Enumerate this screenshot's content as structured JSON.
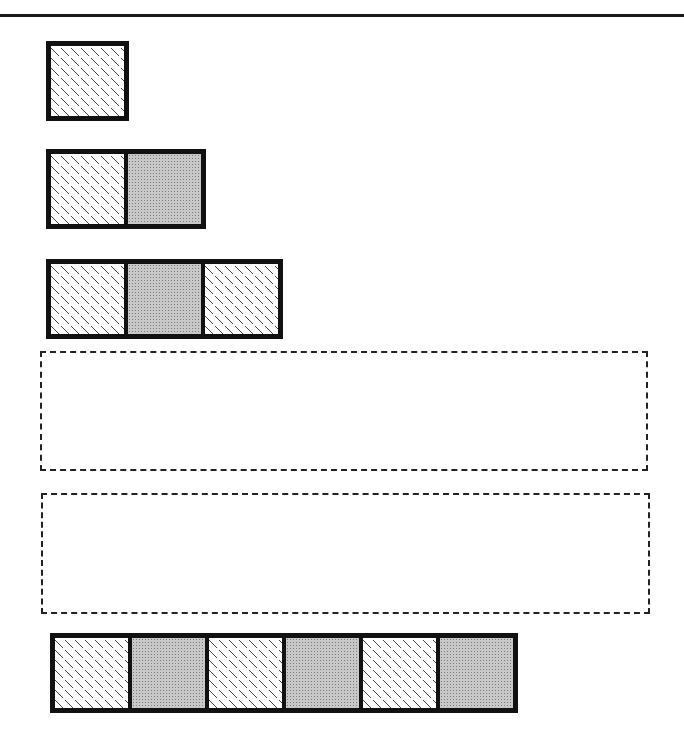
{
  "diagram": {
    "rows": [
      {
        "id": "row-1",
        "tiles": [
          "diamond",
          "stipple"
        ],
        "count": 1,
        "tiles_shown": [
          "diamond"
        ]
      },
      {
        "id": "row-2",
        "count": 2,
        "tiles_shown": [
          "diamond",
          "stipple"
        ]
      },
      {
        "id": "row-3",
        "count": 3,
        "tiles_shown": [
          "diamond",
          "stipple",
          "diamond"
        ]
      },
      {
        "id": "row-4",
        "count": 0,
        "placeholder": "dashed-empty"
      },
      {
        "id": "row-5",
        "count": 0,
        "placeholder": "dashed-empty"
      },
      {
        "id": "row-6",
        "count": 6,
        "tiles_shown": [
          "diamond",
          "stipple",
          "diamond",
          "stipple",
          "diamond",
          "stipple"
        ]
      }
    ],
    "colors": {
      "border": "#111111",
      "stipple_fill": "#c8c8c8",
      "diamond_fill": "#ffffff",
      "dash": "#222222"
    }
  }
}
